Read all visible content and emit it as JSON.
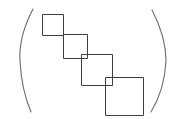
{
  "figure": {
    "title": "Staircase of four squares enclosed in parentheses",
    "background_color": "#ffffff",
    "stroke_color": "#3f3f3f",
    "paren_color": "#6b6b6b",
    "canvas": {
      "width": 177,
      "height": 119
    },
    "caption": "",
    "notation": {
      "left_paren": "(",
      "right_paren": ")"
    }
  },
  "chart_data": {
    "type": "diagram",
    "title": "Staircase of four squares enclosed in parentheses",
    "xlabel": "",
    "ylabel": "",
    "squares": [
      {
        "label": "square-1",
        "x": 42,
        "y": 14,
        "size": 21
      },
      {
        "label": "square-2",
        "x": 63,
        "y": 34,
        "size": 24
      },
      {
        "label": "square-3",
        "x": 81,
        "y": 54,
        "size": 31
      },
      {
        "label": "square-4",
        "x": 105,
        "y": 77,
        "size": 38
      }
    ],
    "parentheses": [
      {
        "label": "left-paren",
        "top": [
          33,
          9
        ],
        "mid": [
          20,
          61
        ],
        "bottom": [
          31,
          112
        ]
      },
      {
        "label": "right-paren",
        "top": [
          152,
          10
        ],
        "mid": [
          166,
          61
        ],
        "bottom": [
          151,
          112
        ]
      }
    ]
  }
}
